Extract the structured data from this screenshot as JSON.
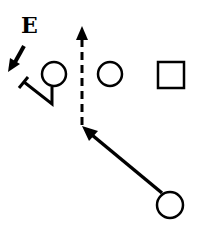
{
  "diagram": {
    "type": "football-play",
    "labels": {
      "end": "E"
    },
    "colors": {
      "stroke": "#000000",
      "background": "#ffffff"
    },
    "players": [
      {
        "id": "end-defender",
        "shape": "arrow",
        "label": "E"
      },
      {
        "id": "player-1",
        "shape": "circle",
        "cx": 54,
        "cy": 74,
        "r": 13
      },
      {
        "id": "player-2",
        "shape": "circle",
        "cx": 110,
        "cy": 74,
        "r": 13
      },
      {
        "id": "player-3",
        "shape": "square",
        "x": 157,
        "y": 61,
        "size": 28
      },
      {
        "id": "player-4",
        "shape": "circle",
        "cx": 170,
        "cy": 205,
        "r": 14
      }
    ],
    "routes": [
      {
        "id": "block-route",
        "style": "solid",
        "ends_in": "T"
      },
      {
        "id": "vertical-route",
        "style": "dashed",
        "ends_in": "arrow"
      },
      {
        "id": "diagonal-route",
        "style": "solid",
        "ends_in": "arrow"
      }
    ]
  }
}
